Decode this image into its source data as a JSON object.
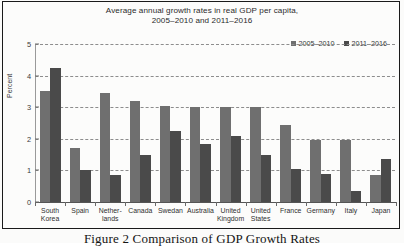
{
  "figure": {
    "caption": "Figure 2 Comparison of GDP Growth Rates"
  },
  "chart_data": {
    "type": "bar",
    "title": "Average annual growth rates in real GDP per capita,",
    "title_line2": "2005–2010 and 2011–2016",
    "xlabel": "",
    "ylabel": "Percent",
    "ylim": [
      0,
      5
    ],
    "yticks": [
      "0",
      "1",
      "2",
      "3",
      "4",
      "5"
    ],
    "grid": true,
    "legend_position": "top-right",
    "categories": [
      "South Korea",
      "Spain",
      "Nether-lands",
      "Canada",
      "Swedan",
      "Australia",
      "United Kingdom",
      "United States",
      "France",
      "Germany",
      "Italy",
      "Japan"
    ],
    "category_lines": [
      [
        "South",
        "Korea"
      ],
      [
        "Spain",
        ""
      ],
      [
        "Nether-",
        "lands"
      ],
      [
        "Canada",
        ""
      ],
      [
        "Swedan",
        ""
      ],
      [
        "Australia",
        ""
      ],
      [
        "United",
        "Kingdom"
      ],
      [
        "United",
        "States"
      ],
      [
        "France",
        ""
      ],
      [
        "Germany",
        ""
      ],
      [
        "Italy",
        ""
      ],
      [
        "Japan",
        ""
      ]
    ],
    "series": [
      {
        "name": "2005–2010",
        "color": "#6f6f6f",
        "values": [
          3.5,
          1.7,
          3.45,
          3.2,
          3.05,
          3.0,
          3.0,
          3.0,
          2.45,
          1.95,
          1.95,
          0.85
        ]
      },
      {
        "name": "2011–2016",
        "color": "#4a4a4a",
        "values": [
          4.25,
          1.0,
          0.85,
          1.5,
          2.25,
          1.85,
          2.1,
          1.5,
          1.05,
          0.9,
          0.35,
          1.35
        ]
      }
    ]
  }
}
